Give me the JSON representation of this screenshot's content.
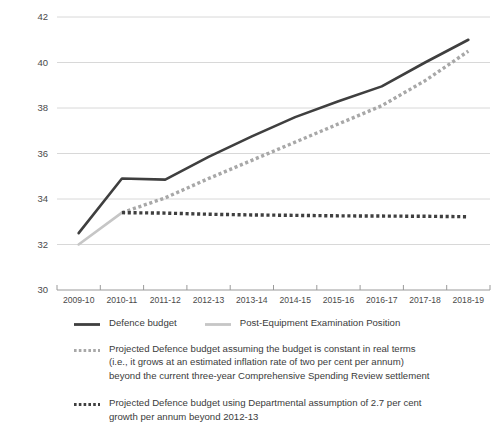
{
  "chart_data": {
    "type": "line",
    "title": "",
    "subtitle": "",
    "xlabel": "",
    "ylabel": "",
    "ylim": [
      30,
      42
    ],
    "ytick_step": 2,
    "ytick_labels": [
      "30",
      "32",
      "34",
      "36",
      "38",
      "40",
      "42"
    ],
    "grid": true,
    "legend_position": "bottom",
    "categories": [
      "2009-10",
      "2010-11",
      "2011-12",
      "2012-13",
      "2013-14",
      "2014-15",
      "2015-16",
      "2016-17",
      "2017-18",
      "2018-19"
    ],
    "series": [
      {
        "name": "Defence budget",
        "style": "solid",
        "color": "#3f3f3f",
        "width": 2.6,
        "values": [
          32.5,
          34.9,
          34.85,
          35.85,
          36.75,
          37.6,
          38.3,
          38.95,
          40.0,
          41.0
        ]
      },
      {
        "name": "Post-Equipment Examination Position",
        "style": "solid",
        "color": "#c6c6c6",
        "width": 2.6,
        "values": [
          32.0,
          33.4,
          null,
          null,
          null,
          null,
          null,
          null,
          null,
          null
        ]
      },
      {
        "name": "Projected Defence budget assuming the budget is constant in real terms (i.e., it grows at an estimated inflation rate of two per cent per annum) beyond the current three-year Comprehensive Spending Review settlement",
        "style": "dashed",
        "color": "#a8a8a8",
        "width": 3.4,
        "values": [
          null,
          33.4,
          34.05,
          34.9,
          35.7,
          36.5,
          37.3,
          38.1,
          39.2,
          40.5
        ]
      },
      {
        "name": "Projected Defence budget using Departmental assumption of 2.7 per cent growth per annum beyond 2012-13",
        "style": "dotted",
        "color": "#3f3f3f",
        "width": 3.4,
        "values": [
          null,
          33.4,
          33.38,
          33.33,
          33.3,
          33.28,
          33.26,
          33.25,
          33.24,
          33.22
        ]
      }
    ]
  },
  "legend": {
    "items": [
      {
        "marker": "solid-dark-line-icon",
        "label": "Defence budget"
      },
      {
        "marker": "solid-light-line-icon",
        "label": "Post-Equipment Examination Position"
      },
      {
        "marker": "dashed-gray-line-icon",
        "lines": [
          "Projected Defence budget assuming the budget is constant in real terms",
          "(i.e., it grows at an estimated inflation rate of two per cent per annum)",
          "beyond the current three-year Comprehensive Spending Review settlement"
        ]
      },
      {
        "marker": "dotted-dark-line-icon",
        "lines": [
          "Projected Defence budget using Departmental assumption of 2.7 per cent",
          "growth per annum beyond 2012-13"
        ]
      }
    ]
  },
  "colors": {
    "defence_budget": "#3f3f3f",
    "post_equipment": "#c6c6c6",
    "projected_real_terms": "#a8a8a8",
    "projected_departmental": "#3f3f3f",
    "gridline": "#d8d8d8",
    "axis": "#9a9a9a",
    "text": "#3b3b3b",
    "background": "#ffffff"
  }
}
